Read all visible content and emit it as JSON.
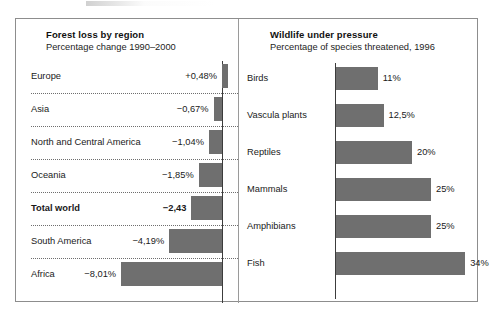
{
  "chart_data": [
    {
      "type": "bar",
      "orientation": "horizontal",
      "id": "forest-loss",
      "title": "Forest loss by region",
      "subtitle": "Percentage change 1990–2000",
      "xlabel": "",
      "ylabel": "",
      "unit": "%",
      "xlim": [
        -8.01,
        0.48
      ],
      "grid": false,
      "legend": "none",
      "categories": [
        "Europe",
        "Asia",
        "North and Central America",
        "Oceania",
        "Total world",
        "South America",
        "Africa"
      ],
      "values": [
        0.48,
        -0.67,
        -1.04,
        -1.85,
        -2.43,
        -4.19,
        -8.01
      ],
      "value_labels": [
        "+0,48%",
        "−0,67%",
        "−1,04%",
        "−1,85%",
        "−2,43",
        "−4,19%",
        "−8,01%"
      ],
      "emphasis": [
        "Total world"
      ],
      "rows": [
        {
          "label": "Europe",
          "value": 0.48,
          "value_label": "+0,48%",
          "bold": false
        },
        {
          "label": "Asia",
          "value": -0.67,
          "value_label": "−0,67%",
          "bold": false
        },
        {
          "label": "North and Central America",
          "value": -1.04,
          "value_label": "−1,04%",
          "bold": false
        },
        {
          "label": "Oceania",
          "value": -1.85,
          "value_label": "−1,85%",
          "bold": false
        },
        {
          "label": "Total world",
          "value": -2.43,
          "value_label": "−2,43",
          "bold": true
        },
        {
          "label": "South America",
          "value": -4.19,
          "value_label": "−4,19%",
          "bold": false
        },
        {
          "label": "Africa",
          "value": -8.01,
          "value_label": "−8,01%",
          "bold": false
        }
      ]
    },
    {
      "type": "bar",
      "orientation": "horizontal",
      "id": "wildlife-threatened",
      "title": "Wildlife under pressure",
      "subtitle": "Percentage of species threatened, 1996",
      "xlabel": "",
      "ylabel": "",
      "unit": "%",
      "xlim": [
        0,
        34
      ],
      "grid": false,
      "legend": "none",
      "categories": [
        "Birds",
        "Vascula plants",
        "Reptiles",
        "Mammals",
        "Amphibians",
        "Fish"
      ],
      "values": [
        11,
        12.5,
        20,
        25,
        25,
        34
      ],
      "value_labels": [
        "11%",
        "12,5%",
        "20%",
        "25%",
        "25%",
        "34%"
      ],
      "rows": [
        {
          "label": "Birds",
          "value": 11,
          "value_label": "11%"
        },
        {
          "label": "Vascula plants",
          "value": 12.5,
          "value_label": "12,5%"
        },
        {
          "label": "Reptiles",
          "value": 20,
          "value_label": "20%"
        },
        {
          "label": "Mammals",
          "value": 25,
          "value_label": "25%"
        },
        {
          "label": "Amphibians",
          "value": 25,
          "value_label": "25%"
        },
        {
          "label": "Fish",
          "value": 34,
          "value_label": "34%"
        }
      ]
    }
  ],
  "colors": {
    "bar_fill": "#6f6f6f",
    "frame_border": "#8d8d8d",
    "axis_line": "#3c3c3c",
    "row_rule": "#6e6e6e",
    "text": "#1a1a1a",
    "background": "#ffffff"
  }
}
